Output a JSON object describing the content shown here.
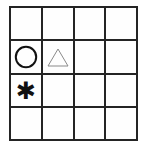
{
  "canvas": {
    "width": 147,
    "height": 151,
    "background_color": "#ffffff"
  },
  "grid": {
    "rows": 4,
    "columns": 4,
    "line_color": "#242424",
    "line_width_px": 2,
    "cell_background_color": "#fefefe"
  },
  "shapes": {
    "circle": {
      "name": "circle",
      "glyph": "circle-outline",
      "stroke_color": "#111111",
      "fill": "none",
      "stroke_width_px": 2
    },
    "triangle": {
      "name": "triangle",
      "glyph": "triangle-outline",
      "stroke_color": "#8a8a8a",
      "fill": "none",
      "stroke_width_px": 1
    },
    "asterisk": {
      "name": "asterisk",
      "glyph": "✱",
      "color": "#111111"
    }
  },
  "cells": [
    {
      "row": 1,
      "col": 1,
      "content": "empty"
    },
    {
      "row": 1,
      "col": 2,
      "content": "empty"
    },
    {
      "row": 1,
      "col": 3,
      "content": "empty"
    },
    {
      "row": 1,
      "col": 4,
      "content": "empty"
    },
    {
      "row": 2,
      "col": 1,
      "content": "circle"
    },
    {
      "row": 2,
      "col": 2,
      "content": "triangle"
    },
    {
      "row": 2,
      "col": 3,
      "content": "empty"
    },
    {
      "row": 2,
      "col": 4,
      "content": "empty"
    },
    {
      "row": 3,
      "col": 1,
      "content": "asterisk"
    },
    {
      "row": 3,
      "col": 2,
      "content": "empty"
    },
    {
      "row": 3,
      "col": 3,
      "content": "empty"
    },
    {
      "row": 3,
      "col": 4,
      "content": "empty"
    },
    {
      "row": 4,
      "col": 1,
      "content": "empty"
    },
    {
      "row": 4,
      "col": 2,
      "content": "empty"
    },
    {
      "row": 4,
      "col": 3,
      "content": "empty"
    },
    {
      "row": 4,
      "col": 4,
      "content": "empty"
    }
  ]
}
